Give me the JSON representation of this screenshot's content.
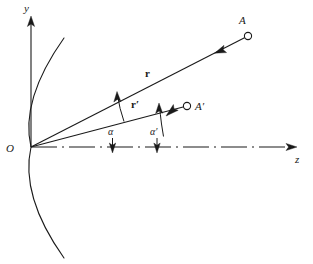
{
  "figure": {
    "kind": "vector-geometry-diagram",
    "width": 313,
    "height": 264,
    "background_color": "#ffffff",
    "stroke_color": "#1a1a1a"
  },
  "axes": {
    "vertical": {
      "label": "y",
      "label_x": 24,
      "label_y": 12,
      "from_x": 31,
      "from_y": 147,
      "to_x": 31,
      "to_y": 17,
      "style": "solid-arrow"
    },
    "horizontal": {
      "label": "z",
      "label_x": 295,
      "label_y": 162,
      "from_x": 31,
      "from_y": 147,
      "to_x": 297,
      "to_y": 147,
      "style": "dash-dot-arrow"
    }
  },
  "origin": {
    "label": "O",
    "label_x": 9,
    "label_y": 151,
    "x": 31,
    "y": 147
  },
  "curve": {
    "name": "wavefront-arc",
    "description": "parabolic arc opening toward -z, vertex at origin",
    "vertex_x": 31,
    "vertex_y": 147,
    "top_x": 64,
    "top_y": 38,
    "bottom_x": 64,
    "bottom_y": 258
  },
  "vectors": [
    {
      "name": "r",
      "label": "r",
      "label_x": 148,
      "label_y": 76,
      "from_x": 31,
      "from_y": 147,
      "to_x": 244,
      "to_y": 38,
      "point_label": "A",
      "point_label_x": 242,
      "point_label_y": 23,
      "point_x": 248,
      "point_y": 36,
      "arrow_x": 218,
      "arrow_y": 51,
      "arrow_direction": "toward-point"
    },
    {
      "name": "r-prime",
      "label": "r′",
      "label_x": 134,
      "label_y": 107,
      "from_x": 31,
      "from_y": 147,
      "to_x": 183,
      "to_y": 107,
      "point_label": "A′",
      "point_label_x": 196,
      "point_label_y": 106,
      "point_x": 187,
      "point_y": 106,
      "arrow_x": 170,
      "arrow_y": 112,
      "arrow_direction": "toward-point"
    }
  ],
  "angles": [
    {
      "name": "alpha",
      "label": "α",
      "label_x": 110,
      "label_y": 134,
      "description": "angle between r and r′, arc with arrowhead at r, pointer arrow down to axis",
      "arc_cx": 31,
      "arc_cy": 147,
      "arc_radius": 98,
      "pointer_from_x": 113,
      "pointer_from_y": 140,
      "pointer_to_x": 113,
      "pointer_to_y": 153
    },
    {
      "name": "alpha-prime",
      "label": "α′",
      "label_x": 152,
      "label_y": 134,
      "description": "angle between z-axis and r′, arc with arrowhead at r′, pointer arrow down to axis",
      "arc_cx": 31,
      "arc_cy": 147,
      "arc_radius": 128,
      "pointer_from_x": 157,
      "pointer_from_y": 140,
      "pointer_to_x": 157,
      "pointer_to_y": 153
    }
  ]
}
